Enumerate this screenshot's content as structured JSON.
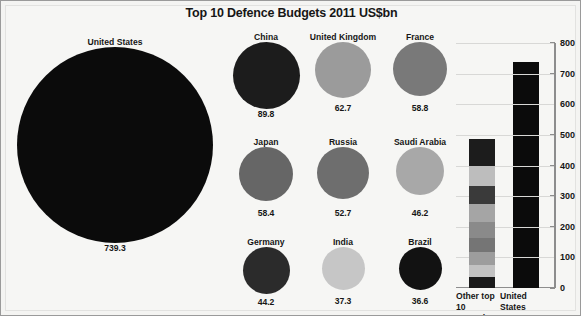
{
  "title": "Top 10 Defence Budgets 2011 US$bn",
  "units": "US$bn",
  "chart_data": {
    "type": "bar",
    "title": "Top 10 Defence Budgets 2011 US$bn",
    "xlabel": "",
    "ylabel": "",
    "ylim": [
      0,
      800
    ],
    "ytick_values": [
      800,
      700,
      600,
      500,
      400,
      300,
      200,
      100,
      0
    ],
    "ytick_labels": [
      "800",
      "700",
      "600",
      "500",
      "400",
      "300",
      "200",
      "100",
      "0"
    ],
    "grid": true,
    "legend": "none",
    "categories": [
      "United States",
      "China",
      "United Kingdom",
      "France",
      "Japan",
      "Russia",
      "Saudi Arabia",
      "Germany",
      "India",
      "Brazil"
    ],
    "values": [
      739.3,
      89.8,
      62.7,
      58.8,
      58.4,
      52.7,
      46.2,
      44.2,
      37.3,
      36.6
    ],
    "bubbles": [
      {
        "name": "United States",
        "value": "739.3",
        "amount": 739.3,
        "color": "#0b0b0b",
        "diameter": 196
      },
      {
        "name": "China",
        "value": "89.8",
        "amount": 89.8,
        "color": "#1c1c1c",
        "diameter": 67
      },
      {
        "name": "United Kingdom",
        "value": "62.7",
        "amount": 62.7,
        "color": "#9b9b9b",
        "diameter": 56
      },
      {
        "name": "France",
        "value": "58.8",
        "amount": 58.8,
        "color": "#797979",
        "diameter": 54
      },
      {
        "name": "Japan",
        "value": "58.4",
        "amount": 58.4,
        "color": "#666666",
        "diameter": 54
      },
      {
        "name": "Russia",
        "value": "52.7",
        "amount": 52.7,
        "color": "#6e6e6e",
        "diameter": 52
      },
      {
        "name": "Saudi Arabia",
        "value": "46.2",
        "amount": 46.2,
        "color": "#a8a8a8",
        "diameter": 48
      },
      {
        "name": "Germany",
        "value": "44.2",
        "amount": 44.2,
        "color": "#2b2b2b",
        "diameter": 47
      },
      {
        "name": "India",
        "value": "37.3",
        "amount": 37.3,
        "color": "#c6c6c6",
        "diameter": 43
      },
      {
        "name": "Brazil",
        "value": "36.6",
        "amount": 36.6,
        "color": "#121212",
        "diameter": 43
      }
    ],
    "bars": [
      {
        "label_line1": "Other top",
        "label_line2": "10 countries",
        "total": 486.7,
        "stacked": true,
        "segments": [
          {
            "name": "China",
            "value": 89.8,
            "color": "#1c1c1c"
          },
          {
            "name": "United Kingdom",
            "value": 62.7,
            "color": "#bdbdbd"
          },
          {
            "name": "France",
            "value": 58.8,
            "color": "#3a3a3a"
          },
          {
            "name": "Japan",
            "value": 58.4,
            "color": "#a5a5a5"
          },
          {
            "name": "Russia",
            "value": 52.7,
            "color": "#8a8a8a"
          },
          {
            "name": "Saudi Arabia",
            "value": 46.2,
            "color": "#757575"
          },
          {
            "name": "Germany",
            "value": 44.2,
            "color": "#9d9d9d"
          },
          {
            "name": "India",
            "value": 37.3,
            "color": "#c2c2c2"
          },
          {
            "name": "Brazil",
            "value": 36.6,
            "color": "#1a1a1a"
          }
        ]
      },
      {
        "label_line1": "United",
        "label_line2": "States",
        "total": 739.3,
        "stacked": false,
        "segments": [
          {
            "name": "United States",
            "value": 739.3,
            "color": "#0b0b0b"
          }
        ]
      }
    ]
  }
}
